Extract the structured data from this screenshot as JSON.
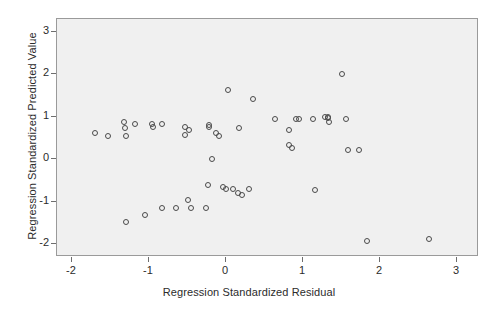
{
  "chart_data": {
    "type": "scatter",
    "title": "",
    "xlabel": "Regression Standardized Residual",
    "ylabel": "Regression Standardized Predicted Value",
    "xlim": [
      -2.2,
      3.3
    ],
    "ylim": [
      -2.3,
      3.2
    ],
    "xticks": [
      -2,
      -1,
      0,
      1,
      2,
      3
    ],
    "xticklabels": [
      "-2",
      "-1",
      "0",
      "1",
      "2",
      "3"
    ],
    "yticks": [
      -2,
      -1,
      0,
      1,
      2,
      3
    ],
    "yticklabels": [
      "-2",
      "-1",
      "0",
      "1",
      "2",
      "3"
    ],
    "grid": false,
    "legend": false,
    "marker": "open-circle",
    "marker_color": "#4a4a4a",
    "plot_background": "#f0f0f0",
    "figure_background": "#ffffff",
    "points": [
      {
        "x": -1.69,
        "y": 0.59
      },
      {
        "x": -1.52,
        "y": 0.54
      },
      {
        "x": -1.32,
        "y": 0.85
      },
      {
        "x": -1.31,
        "y": 0.71
      },
      {
        "x": -1.29,
        "y": 0.54
      },
      {
        "x": -1.18,
        "y": 0.82
      },
      {
        "x": -0.96,
        "y": 0.82
      },
      {
        "x": -0.94,
        "y": 0.73
      },
      {
        "x": -0.82,
        "y": 0.82
      },
      {
        "x": -0.52,
        "y": 0.75
      },
      {
        "x": -0.48,
        "y": 0.68
      },
      {
        "x": -0.52,
        "y": 0.56
      },
      {
        "x": -0.22,
        "y": 0.75
      },
      {
        "x": -0.21,
        "y": 0.78
      },
      {
        "x": -0.12,
        "y": 0.61
      },
      {
        "x": -0.09,
        "y": 0.54
      },
      {
        "x": 0.17,
        "y": 0.71
      },
      {
        "x": -0.17,
        "y": -0.02
      },
      {
        "x": 0.03,
        "y": 1.62
      },
      {
        "x": 0.36,
        "y": 1.41
      },
      {
        "x": 0.64,
        "y": 0.94
      },
      {
        "x": 0.91,
        "y": 0.92
      },
      {
        "x": 0.82,
        "y": 0.66
      },
      {
        "x": 0.95,
        "y": 0.92
      },
      {
        "x": 1.14,
        "y": 0.92
      },
      {
        "x": 1.34,
        "y": 0.85
      },
      {
        "x": 1.29,
        "y": 0.98
      },
      {
        "x": 1.51,
        "y": 2.0
      },
      {
        "x": 1.33,
        "y": 0.97
      },
      {
        "x": 1.57,
        "y": 0.94
      },
      {
        "x": 1.33,
        "y": 0.96
      },
      {
        "x": 0.82,
        "y": 0.31
      },
      {
        "x": 0.87,
        "y": 0.24
      },
      {
        "x": 1.59,
        "y": 0.21
      },
      {
        "x": 1.74,
        "y": 0.21
      },
      {
        "x": -1.29,
        "y": -1.49
      },
      {
        "x": -1.04,
        "y": -1.33
      },
      {
        "x": -0.82,
        "y": -1.17
      },
      {
        "x": -0.64,
        "y": -1.17
      },
      {
        "x": -0.49,
        "y": -0.97
      },
      {
        "x": -0.45,
        "y": -1.17
      },
      {
        "x": -0.25,
        "y": -1.17
      },
      {
        "x": -0.23,
        "y": -0.62
      },
      {
        "x": -0.03,
        "y": -0.68
      },
      {
        "x": 0.0,
        "y": -0.71
      },
      {
        "x": 0.1,
        "y": -0.71
      },
      {
        "x": 0.16,
        "y": -0.8
      },
      {
        "x": 0.22,
        "y": -0.85
      },
      {
        "x": 0.31,
        "y": -0.71
      },
      {
        "x": 1.16,
        "y": -0.73
      },
      {
        "x": 1.84,
        "y": -1.95
      },
      {
        "x": 2.64,
        "y": -1.9
      }
    ]
  }
}
